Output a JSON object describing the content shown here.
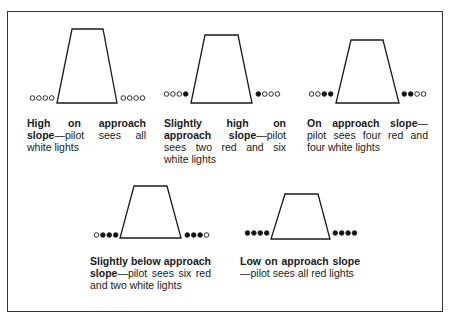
{
  "figure": {
    "colors": {
      "line": "#1a1a1a",
      "white_light_fill": "#ffffff",
      "red_light_fill": "#111111"
    },
    "panels": [
      {
        "id": "high",
        "title": "High on approach slope",
        "desc": "—pilot sees all white lights",
        "trapezoid": {
          "top": [
            72,
            29,
            103,
            29
          ],
          "bottom": [
            57,
            103,
            117,
            103
          ]
        },
        "lights_left": [
          "white",
          "white",
          "white",
          "white"
        ],
        "lights_right": [
          "white",
          "white",
          "white",
          "white"
        ],
        "lights_y": 98,
        "left_x_end": 54,
        "right_x_start": 121,
        "caption": {
          "left": 27,
          "top": 117,
          "width": 119
        }
      },
      {
        "id": "slightly-high",
        "title": "Slightly high on approach slope",
        "desc": "—pilot sees two red and six white lights",
        "trapezoid": {
          "top": [
            205,
            35,
            238,
            35
          ],
          "bottom": [
            191,
            103,
            252,
            103
          ]
        },
        "lights_left": [
          "white",
          "white",
          "white",
          "red"
        ],
        "lights_right": [
          "red",
          "white",
          "white",
          "white"
        ],
        "lights_y": 94,
        "left_x_end": 188,
        "right_x_start": 256,
        "caption": {
          "left": 164,
          "top": 117,
          "width": 122
        }
      },
      {
        "id": "on-slope",
        "title": "On approach slope",
        "desc": "—pilot sees four red and four white lights",
        "trapezoid": {
          "top": [
            351,
            40,
            383,
            40
          ],
          "bottom": [
            336,
            103,
            399,
            103
          ]
        },
        "lights_left": [
          "white",
          "white",
          "red",
          "red"
        ],
        "lights_right": [
          "red",
          "red",
          "white",
          "white"
        ],
        "lights_y": 94,
        "left_x_end": 333,
        "right_x_start": 402,
        "caption": {
          "left": 307,
          "top": 117,
          "width": 121
        }
      },
      {
        "id": "slightly-below",
        "title": "Slightly below approach slope",
        "desc": "—pilot sees six red and two white lights",
        "trapezoid": {
          "top": [
            134,
            186,
            167,
            186
          ],
          "bottom": [
            120,
            238,
            181,
            238
          ]
        },
        "lights_left": [
          "white",
          "red",
          "red",
          "red"
        ],
        "lights_right": [
          "red",
          "red",
          "red",
          "white"
        ],
        "lights_y": 235,
        "left_x_end": 118,
        "right_x_start": 185,
        "caption": {
          "left": 90,
          "top": 255,
          "width": 121
        }
      },
      {
        "id": "low",
        "title": "Low on approach slope",
        "desc": "—pilot sees all red lights",
        "trapezoid": {
          "top": [
            285,
            194,
            318,
            194
          ],
          "bottom": [
            271,
            239,
            330,
            239
          ]
        },
        "lights_left": [
          "red",
          "red",
          "red",
          "red"
        ],
        "lights_right": [
          "red",
          "red",
          "red",
          "red"
        ],
        "lights_y": 233,
        "left_x_end": 269,
        "right_x_start": 333,
        "caption": {
          "left": 240,
          "top": 255,
          "width": 120
        }
      }
    ]
  }
}
